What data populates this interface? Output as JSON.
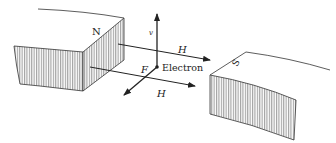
{
  "diagram": {
    "type": "physics-illustration",
    "labels": {
      "north_pole": "N",
      "south_pole": "S",
      "velocity": "v",
      "field_upper": "H",
      "field_lower": "H",
      "force": "F",
      "electron": "Electron"
    },
    "colors": {
      "stroke": "#222222",
      "hatch": "#8a8a8a",
      "background": "#ffffff"
    }
  }
}
